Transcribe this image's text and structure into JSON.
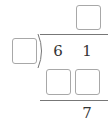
{
  "problem": {
    "type": "long-division",
    "dividend_digits": [
      "6",
      "1"
    ],
    "remainder_digits": [
      "7"
    ],
    "quotient_blanks": 1,
    "divisor_blanks": 1,
    "product_blanks": 2
  },
  "colors": {
    "box_border": "#a8a8a8",
    "line": "#777777",
    "text": "#333333"
  }
}
